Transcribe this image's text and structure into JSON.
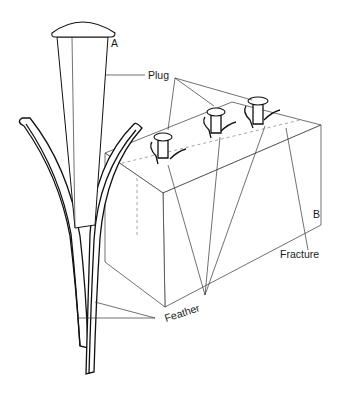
{
  "diagram": {
    "labels": {
      "point_a": "A",
      "point_b": "B",
      "plug": "Plug",
      "feather": "Feather",
      "fracture": "Fracture"
    },
    "components": [
      "plug",
      "feather",
      "stone block",
      "fracture line"
    ],
    "plugs_in_block": 3
  }
}
